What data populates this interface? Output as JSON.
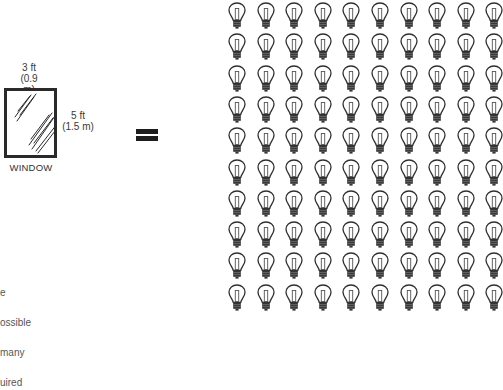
{
  "diagram": {
    "window": {
      "label": "WINDOW",
      "width_label": "3 ft",
      "width_metric": "(0.9 m)",
      "height_label": "5 ft",
      "height_metric": "(1.5 m)"
    },
    "operator": "=",
    "bulbs": {
      "rows": 10,
      "columns": 10,
      "count": 100,
      "icon": "light-bulb-icon"
    },
    "clipped_caption_lines": [
      "e",
      "ossible",
      "many",
      "uired"
    ],
    "colors": {
      "stroke": "#2a2a2a",
      "bulb_base": "#333333",
      "text": "#333333"
    }
  }
}
